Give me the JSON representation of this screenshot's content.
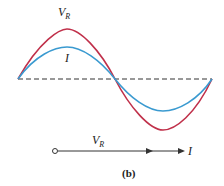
{
  "figure": {
    "caption": "(b)",
    "waveform": {
      "voltage_label_main": "V",
      "voltage_label_sub": "R",
      "current_label": "I",
      "voltage_color": "#c0304a",
      "current_color": "#3a9ad0",
      "axis_style": "dashed"
    },
    "phasor": {
      "voltage_label_main": "V",
      "voltage_label_sub": "R",
      "current_label": "I"
    }
  }
}
